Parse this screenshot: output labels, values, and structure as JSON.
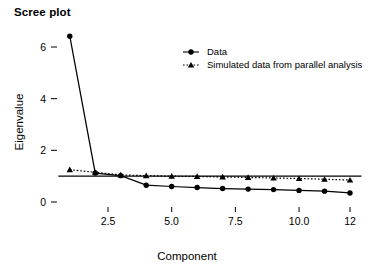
{
  "chart_data": {
    "type": "line",
    "title": "Scree plot",
    "xlabel": "Component",
    "ylabel": "Eigenvalue",
    "x": [
      1,
      2,
      3,
      4,
      5,
      6,
      7,
      8,
      9,
      10,
      11,
      12
    ],
    "series": [
      {
        "name": "Data",
        "marker": "circle",
        "linestyle": "solid",
        "values": [
          6.42,
          1.12,
          1.02,
          0.65,
          0.6,
          0.56,
          0.52,
          0.5,
          0.48,
          0.45,
          0.42,
          0.35
        ]
      },
      {
        "name": "Simulated data from parallel analysis",
        "marker": "triangle",
        "linestyle": "dotted",
        "values": [
          1.25,
          1.15,
          1.05,
          1.02,
          1.0,
          0.99,
          0.97,
          0.95,
          0.93,
          0.91,
          0.88,
          0.85
        ]
      }
    ],
    "reference_line": {
      "name": "eigenvalue-one-line",
      "orientation": "horizontal",
      "value": 1
    },
    "xticks": [
      {
        "value": 2.5,
        "label": "2.5"
      },
      {
        "value": 5.0,
        "label": "5.0"
      },
      {
        "value": 7.5,
        "label": "7.5"
      },
      {
        "value": 10.0,
        "label": "10.0"
      },
      {
        "value": 12.0,
        "label": "12"
      }
    ],
    "yticks": [
      {
        "value": 0,
        "label": "0"
      },
      {
        "value": 2,
        "label": "2"
      },
      {
        "value": 4,
        "label": "4"
      },
      {
        "value": 6,
        "label": "6"
      }
    ],
    "xlim": [
      0.55,
      12.45
    ],
    "ylim": [
      -0.35,
      6.95
    ],
    "grid": false,
    "legend_position": "top-center-right",
    "colors": {
      "line": "#000000",
      "marker": "#000000",
      "text": "#000000",
      "background": "#ffffff"
    }
  },
  "legend": {
    "items": [
      {
        "label": "Data",
        "marker": "circle"
      },
      {
        "label": "Simulated data from parallel analysis",
        "marker": "triangle"
      }
    ]
  }
}
